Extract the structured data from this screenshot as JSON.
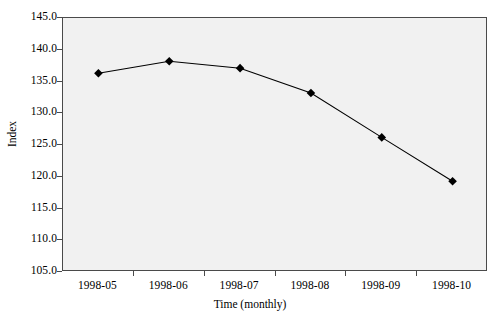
{
  "chart_data": {
    "type": "line",
    "title": "",
    "xlabel": "Time (monthly)",
    "ylabel": "Index",
    "categories": [
      "1998-05",
      "1998-06",
      "1998-07",
      "1998-08",
      "1998-09",
      "1998-10"
    ],
    "values": [
      136.3,
      138.2,
      137.1,
      133.2,
      126.2,
      119.3
    ],
    "series": [
      {
        "name": "Index",
        "values": [
          136.3,
          138.2,
          137.1,
          133.2,
          126.2,
          119.3
        ]
      }
    ],
    "ylim": [
      105.0,
      145.0
    ],
    "ytick_step": 5.0,
    "yticks": [
      "145.0",
      "140.0",
      "135.0",
      "130.0",
      "125.0",
      "120.0",
      "115.0",
      "110.0",
      "105.0"
    ],
    "ytick_values": [
      145.0,
      140.0,
      135.0,
      130.0,
      125.0,
      120.0,
      115.0,
      110.0,
      105.0
    ],
    "grid": false,
    "legend": "none",
    "marker": "diamond",
    "colors": {
      "line": "#000000",
      "marker": "#000000",
      "plot_background": "#f1f1f1",
      "axis": "#4a4a4a",
      "figure_background": "#ffffff",
      "text": "#000000"
    }
  }
}
